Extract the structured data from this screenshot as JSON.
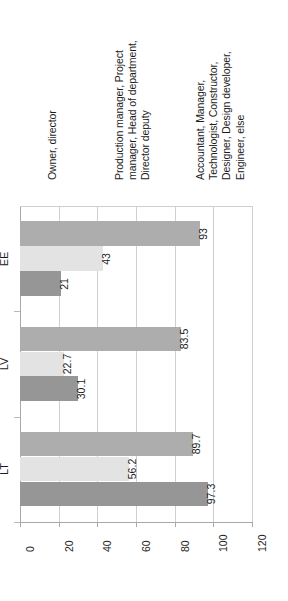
{
  "chart_data": {
    "type": "bar",
    "title": "",
    "xlabel": "",
    "ylabel": "",
    "categories": [
      "EE",
      "LV",
      "LT"
    ],
    "ylim": [
      0,
      120
    ],
    "yticks": [
      0,
      20,
      40,
      60,
      80,
      100,
      120
    ],
    "grid": true,
    "orientation": "rotated-90-ccw",
    "legend_position": "top",
    "series": [
      {
        "name": "Owner, director",
        "color": "#adadad",
        "values": [
          93,
          83.5,
          89.7
        ],
        "labels": [
          "93",
          "83.5",
          "89.7"
        ]
      },
      {
        "name": "Production manager, Project manager, Head of department, Director deputy",
        "color": "#e3e3e3",
        "values": [
          43,
          22.7,
          56.2
        ],
        "labels": [
          "43",
          "22.7",
          "56.2"
        ]
      },
      {
        "name": "Accountant, Manager, Technologist, Constructor, Designer, Design developer, Engineer, else",
        "color": "#969696",
        "values": [
          21,
          30.1,
          97.3
        ],
        "labels": [
          "21",
          "30.1",
          "97.3"
        ]
      }
    ]
  },
  "legend": {
    "items": [
      {
        "label_lines": "Owner, director",
        "marker": "legend-swatch-series-1",
        "color": "#adadad"
      },
      {
        "label_lines": "Production manager, Project\nmanager, Head of department,\nDirector deputy",
        "marker": "legend-swatch-series-2",
        "color": "#e3e3e3"
      },
      {
        "label_lines": "Accountant, Manager,\nTechnologist, Constructor,\nDesigner, Design developer,\nEngineer, else",
        "marker": "legend-swatch-series-3",
        "color": "#969696"
      }
    ]
  },
  "axis": {
    "ytick_labels": [
      "0",
      "20",
      "40",
      "60",
      "80",
      "100",
      "120"
    ],
    "category_labels": [
      "EE",
      "LV",
      "LT"
    ]
  }
}
